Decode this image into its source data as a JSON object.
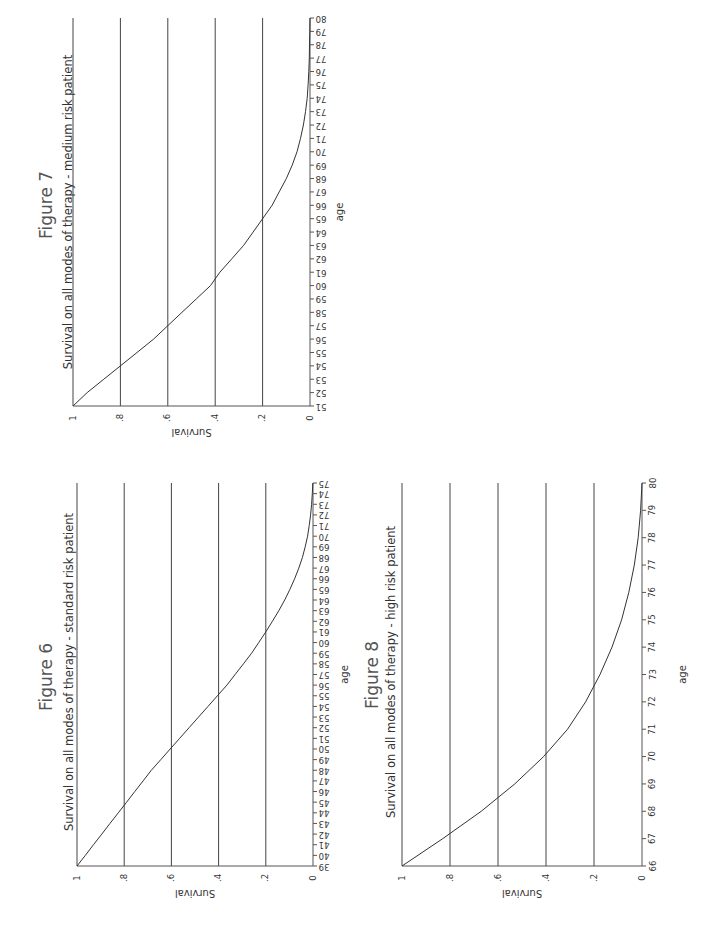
{
  "page": {
    "background": "#ffffff",
    "line_color": "#333333"
  },
  "figures": [
    {
      "id": "figure-7",
      "title": "Figure 7",
      "subtitle": "Survival on all modes of therapy - medium risk patient",
      "xlabel": "age",
      "ylabel": "Survival",
      "y_ticks": [
        "1",
        ".8",
        ".6",
        ".4",
        ".2",
        "0"
      ],
      "x_tick_style": "vertical",
      "geometry": {
        "x_one": 73,
        "x_zero": 310,
        "y_min_age": 406,
        "y_max_age": 18,
        "title_x": 47,
        "subtitle_x": 68,
        "title_center_y": 205,
        "subtitle_center_y": 212,
        "ylabel_y": 432,
        "xlabel_x": 340
      }
    },
    {
      "id": "figure-6",
      "title": "Figure 6",
      "subtitle": "Survival on all modes of therapy - standard risk patient",
      "xlabel": "age",
      "ylabel": "Survival",
      "y_ticks": [
        "1",
        ".8",
        ".6",
        ".4",
        ".2",
        "0"
      ],
      "x_tick_style": "vertical",
      "geometry": {
        "x_one": 77,
        "x_zero": 313,
        "y_min_age": 866,
        "y_max_age": 483,
        "title_x": 47,
        "subtitle_x": 69,
        "title_center_y": 677,
        "subtitle_center_y": 672,
        "ylabel_y": 893,
        "xlabel_x": 345
      }
    },
    {
      "id": "figure-8",
      "title": "Figure 8",
      "subtitle": "Survival on all modes of therapy - high risk patient",
      "xlabel": "age",
      "ylabel": "Survival",
      "y_ticks": [
        "1",
        ".8",
        ".6",
        ".4",
        ".2",
        "0"
      ],
      "x_tick_style": "horizontal",
      "geometry": {
        "x_one": 402,
        "x_zero": 642,
        "y_min_age": 866,
        "y_max_age": 483,
        "title_x": 373,
        "subtitle_x": 391,
        "title_center_y": 675,
        "subtitle_center_y": 672,
        "ylabel_y": 893,
        "xlabel_x": 683
      }
    }
  ],
  "chart_data": [
    {
      "type": "line",
      "title": "Figure 7",
      "subtitle": "Survival on all modes of therapy - medium risk patient",
      "xlabel": "age",
      "ylabel": "Survival",
      "xlim": [
        51,
        80
      ],
      "ylim": [
        0,
        1
      ],
      "x_ticks": [
        51,
        52,
        53,
        54,
        55,
        56,
        57,
        58,
        59,
        60,
        61,
        62,
        63,
        64,
        65,
        66,
        67,
        68,
        69,
        70,
        71,
        72,
        73,
        74,
        75,
        76,
        77,
        78,
        79,
        80
      ],
      "y_ticks": [
        0,
        0.2,
        0.4,
        0.6,
        0.8,
        1
      ],
      "grid": "horizontal lines at y ticks",
      "orientation": "rotated 90 degrees counter-clockwise on page",
      "series": [
        {
          "name": "Survival",
          "x": [
            51,
            52,
            53,
            54,
            55,
            56,
            57,
            58,
            59,
            60,
            61,
            62,
            63,
            64,
            65,
            66,
            67,
            68,
            69,
            70,
            71,
            72,
            73,
            74,
            75,
            76,
            77,
            78,
            79,
            80
          ],
          "y": [
            1.0,
            0.94,
            0.87,
            0.8,
            0.73,
            0.66,
            0.6,
            0.54,
            0.48,
            0.42,
            0.38,
            0.33,
            0.28,
            0.24,
            0.2,
            0.16,
            0.13,
            0.1,
            0.075,
            0.055,
            0.04,
            0.028,
            0.019,
            0.012,
            0.008,
            0.005,
            0.003,
            0.002,
            0.001,
            0.0
          ]
        }
      ]
    },
    {
      "type": "line",
      "title": "Figure 6",
      "subtitle": "Survival on all modes of therapy - standard risk patient",
      "xlabel": "age",
      "ylabel": "Survival",
      "xlim": [
        39,
        75
      ],
      "ylim": [
        0,
        1
      ],
      "x_ticks": [
        39,
        40,
        41,
        42,
        43,
        44,
        45,
        46,
        47,
        48,
        49,
        50,
        51,
        52,
        53,
        54,
        55,
        56,
        57,
        58,
        59,
        60,
        61,
        62,
        63,
        64,
        65,
        66,
        67,
        68,
        69,
        70,
        71,
        72,
        73,
        74,
        75
      ],
      "y_ticks": [
        0,
        0.2,
        0.4,
        0.6,
        0.8,
        1
      ],
      "grid": "horizontal lines at y ticks",
      "orientation": "rotated 90 degrees counter-clockwise on page",
      "series": [
        {
          "name": "Survival",
          "x": [
            39,
            40,
            41,
            42,
            43,
            44,
            45,
            46,
            47,
            48,
            49,
            50,
            51,
            52,
            53,
            54,
            55,
            56,
            57,
            58,
            59,
            60,
            61,
            62,
            63,
            64,
            65,
            66,
            67,
            68,
            69,
            70,
            71,
            72,
            73,
            74,
            75
          ],
          "y": [
            1.0,
            0.965,
            0.93,
            0.895,
            0.86,
            0.825,
            0.79,
            0.755,
            0.72,
            0.685,
            0.645,
            0.605,
            0.565,
            0.525,
            0.485,
            0.445,
            0.405,
            0.365,
            0.33,
            0.295,
            0.26,
            0.23,
            0.2,
            0.172,
            0.145,
            0.12,
            0.098,
            0.078,
            0.06,
            0.045,
            0.033,
            0.023,
            0.016,
            0.01,
            0.006,
            0.003,
            0.001
          ]
        }
      ]
    },
    {
      "type": "line",
      "title": "Figure 8",
      "subtitle": "Survival on all modes of therapy - high risk patient",
      "xlabel": "age",
      "ylabel": "Survival",
      "xlim": [
        66,
        80
      ],
      "ylim": [
        0,
        1
      ],
      "x_ticks": [
        66,
        67,
        68,
        69,
        70,
        71,
        72,
        73,
        74,
        75,
        76,
        77,
        78,
        79,
        80
      ],
      "y_ticks": [
        0,
        0.2,
        0.4,
        0.6,
        0.8,
        1
      ],
      "grid": "horizontal lines at y ticks",
      "orientation": "rotated 90 degrees counter-clockwise on page",
      "series": [
        {
          "name": "Survival",
          "x": [
            66,
            67,
            68,
            69,
            70,
            71,
            72,
            73,
            74,
            75,
            76,
            77,
            78,
            79,
            80
          ],
          "y": [
            1.0,
            0.83,
            0.67,
            0.53,
            0.41,
            0.31,
            0.235,
            0.175,
            0.125,
            0.085,
            0.055,
            0.032,
            0.016,
            0.006,
            0.0
          ]
        }
      ]
    }
  ]
}
